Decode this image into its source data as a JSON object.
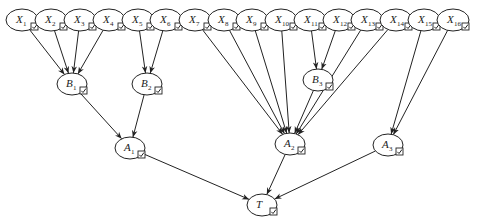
{
  "diagram": {
    "title": "",
    "type": "bayesian-network-tree",
    "colors": {
      "stroke": "#222222",
      "background": "#ffffff"
    },
    "nodes": [
      {
        "id": "X1",
        "letter": "X",
        "sub": "1",
        "x": 22,
        "y": 20,
        "rx": 16,
        "ry": 11
      },
      {
        "id": "X2",
        "letter": "X",
        "sub": "2",
        "x": 51,
        "y": 20,
        "rx": 16,
        "ry": 11
      },
      {
        "id": "X3",
        "letter": "X",
        "sub": "3",
        "x": 80,
        "y": 20,
        "rx": 16,
        "ry": 11
      },
      {
        "id": "X4",
        "letter": "X",
        "sub": "4",
        "x": 109,
        "y": 20,
        "rx": 16,
        "ry": 11
      },
      {
        "id": "X5",
        "letter": "X",
        "sub": "5",
        "x": 138,
        "y": 20,
        "rx": 16,
        "ry": 11
      },
      {
        "id": "X6",
        "letter": "X",
        "sub": "6",
        "x": 166,
        "y": 20,
        "rx": 16,
        "ry": 11
      },
      {
        "id": "X7",
        "letter": "X",
        "sub": "7",
        "x": 195,
        "y": 20,
        "rx": 16,
        "ry": 11
      },
      {
        "id": "X8",
        "letter": "X",
        "sub": "8",
        "x": 224,
        "y": 20,
        "rx": 16,
        "ry": 11
      },
      {
        "id": "X9",
        "letter": "X",
        "sub": "9",
        "x": 252,
        "y": 20,
        "rx": 16,
        "ry": 11
      },
      {
        "id": "X10",
        "letter": "X",
        "sub": "10",
        "x": 281,
        "y": 20,
        "rx": 16,
        "ry": 11
      },
      {
        "id": "X11",
        "letter": "X",
        "sub": "11",
        "x": 310,
        "y": 20,
        "rx": 16,
        "ry": 11
      },
      {
        "id": "X12",
        "letter": "X",
        "sub": "12",
        "x": 339,
        "y": 20,
        "rx": 16,
        "ry": 11
      },
      {
        "id": "X13",
        "letter": "X",
        "sub": "13",
        "x": 367,
        "y": 20,
        "rx": 16,
        "ry": 11
      },
      {
        "id": "X14",
        "letter": "X",
        "sub": "14",
        "x": 396,
        "y": 20,
        "rx": 16,
        "ry": 11
      },
      {
        "id": "X15",
        "letter": "X",
        "sub": "15",
        "x": 424,
        "y": 20,
        "rx": 16,
        "ry": 11
      },
      {
        "id": "X16",
        "letter": "X",
        "sub": "16",
        "x": 453,
        "y": 20,
        "rx": 16,
        "ry": 11
      },
      {
        "id": "B1",
        "letter": "B",
        "sub": "1",
        "x": 72,
        "y": 84,
        "rx": 15,
        "ry": 11
      },
      {
        "id": "B2",
        "letter": "B",
        "sub": "2",
        "x": 147,
        "y": 84,
        "rx": 15,
        "ry": 11
      },
      {
        "id": "B3",
        "letter": "B",
        "sub": "3",
        "x": 318,
        "y": 80,
        "rx": 15,
        "ry": 11
      },
      {
        "id": "A1",
        "letter": "A",
        "sub": "1",
        "x": 130,
        "y": 148,
        "rx": 15,
        "ry": 11
      },
      {
        "id": "A2",
        "letter": "A",
        "sub": "2",
        "x": 290,
        "y": 144,
        "rx": 15,
        "ry": 11
      },
      {
        "id": "A3",
        "letter": "A",
        "sub": "3",
        "x": 388,
        "y": 145,
        "rx": 15,
        "ry": 11
      },
      {
        "id": "T",
        "letter": "T",
        "sub": "",
        "x": 262,
        "y": 205,
        "rx": 15,
        "ry": 11
      }
    ],
    "edges": [
      [
        "X1",
        "B1"
      ],
      [
        "X2",
        "B1"
      ],
      [
        "X3",
        "B1"
      ],
      [
        "X4",
        "B1"
      ],
      [
        "X5",
        "B2"
      ],
      [
        "X6",
        "B2"
      ],
      [
        "X7",
        "A2"
      ],
      [
        "X8",
        "A2"
      ],
      [
        "X9",
        "A2"
      ],
      [
        "X10",
        "A2"
      ],
      [
        "X11",
        "B3"
      ],
      [
        "X12",
        "B3"
      ],
      [
        "X13",
        "A2"
      ],
      [
        "X14",
        "A2"
      ],
      [
        "B3",
        "A2"
      ],
      [
        "X15",
        "A3"
      ],
      [
        "X16",
        "A3"
      ],
      [
        "B1",
        "A1"
      ],
      [
        "B2",
        "A1"
      ],
      [
        "A1",
        "T"
      ],
      [
        "A2",
        "T"
      ],
      [
        "A3",
        "T"
      ]
    ],
    "node_icon": "checkbox-checked-icon"
  }
}
